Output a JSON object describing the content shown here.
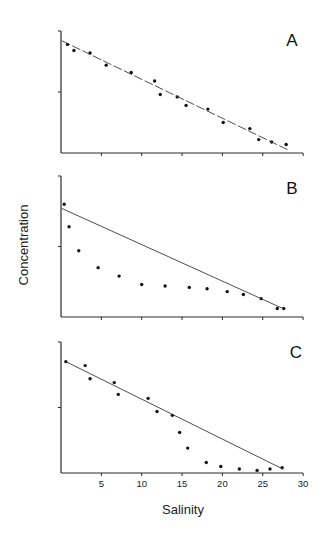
{
  "chart_data": {
    "type": "scatter",
    "layout": "three vertically stacked panels sharing x-axis",
    "xlabel": "Salinity",
    "ylabel": "Concentration",
    "xlim": [
      0,
      30
    ],
    "x_ticks": [
      5,
      10,
      15,
      20,
      25,
      30
    ],
    "grid": false,
    "legend": null,
    "y_units": "arbitrary (0 at x-axis, 10 at top of y-axis, single mid tick at 5)",
    "panels": [
      {
        "label": "A",
        "ylim": [
          0,
          10
        ],
        "series": [
          {
            "name": "observations",
            "type": "scatter",
            "x": [
              0.8,
              1.6,
              3.6,
              5.6,
              8.7,
              11.6,
              12.3,
              14.4,
              15.5,
              18.2,
              20.1,
              23.4,
              24.5,
              26.1,
              27.9
            ],
            "y": [
              8.9,
              8.4,
              8.2,
              7.2,
              6.6,
              5.9,
              4.8,
              4.6,
              3.9,
              3.6,
              2.5,
              2.0,
              1.1,
              0.9,
              0.7
            ]
          },
          {
            "name": "theoretical dilution line",
            "type": "line",
            "style": "dashed",
            "x": [
              0.1,
              28.3
            ],
            "y": [
              9.2,
              0.2
            ]
          }
        ]
      },
      {
        "label": "B",
        "ylim": [
          0,
          10
        ],
        "series": [
          {
            "name": "observations",
            "type": "scatter",
            "x": [
              0.4,
              1.0,
              2.2,
              4.6,
              7.2,
              10.0,
              12.9,
              15.9,
              18.1,
              20.6,
              22.6,
              24.8,
              26.8,
              27.6
            ],
            "y": [
              8.0,
              6.4,
              4.7,
              3.5,
              2.9,
              2.3,
              2.2,
              2.1,
              2.0,
              1.8,
              1.6,
              1.3,
              0.6,
              0.6
            ]
          },
          {
            "name": "theoretical dilution line",
            "type": "line",
            "style": "solid",
            "x": [
              0.1,
              27.5
            ],
            "y": [
              7.7,
              0.6
            ]
          }
        ]
      },
      {
        "label": "C",
        "ylim": [
          0,
          10
        ],
        "series": [
          {
            "name": "observations",
            "type": "scatter",
            "x": [
              0.6,
              3.0,
              3.6,
              6.6,
              7.1,
              10.8,
              11.9,
              13.8,
              14.7,
              15.7,
              18.0,
              19.8,
              22.1,
              24.3,
              25.9,
              27.4
            ],
            "y": [
              8.5,
              8.2,
              7.2,
              6.9,
              6.0,
              5.7,
              4.7,
              4.4,
              3.1,
              1.9,
              0.8,
              0.5,
              0.3,
              0.2,
              0.3,
              0.4
            ]
          },
          {
            "name": "theoretical dilution line",
            "type": "line",
            "style": "solid",
            "x": [
              0.6,
              27.5
            ],
            "y": [
              8.5,
              0.3
            ]
          }
        ]
      }
    ]
  },
  "layout": {
    "x_px": {
      "origin": 61,
      "per_unit": 8.07
    },
    "panels_px": [
      {
        "top": 31,
        "bottom": 153,
        "label_x": 292,
        "label_y": 46
      },
      {
        "top": 176,
        "bottom": 317,
        "label_x": 292,
        "label_y": 194
      },
      {
        "top": 342,
        "bottom": 473,
        "label_x": 296,
        "label_y": 358
      }
    ],
    "xlabel_pos": {
      "x": 183,
      "y": 514
    },
    "ylabel_pos": {
      "x": 28,
      "y": 245
    }
  }
}
